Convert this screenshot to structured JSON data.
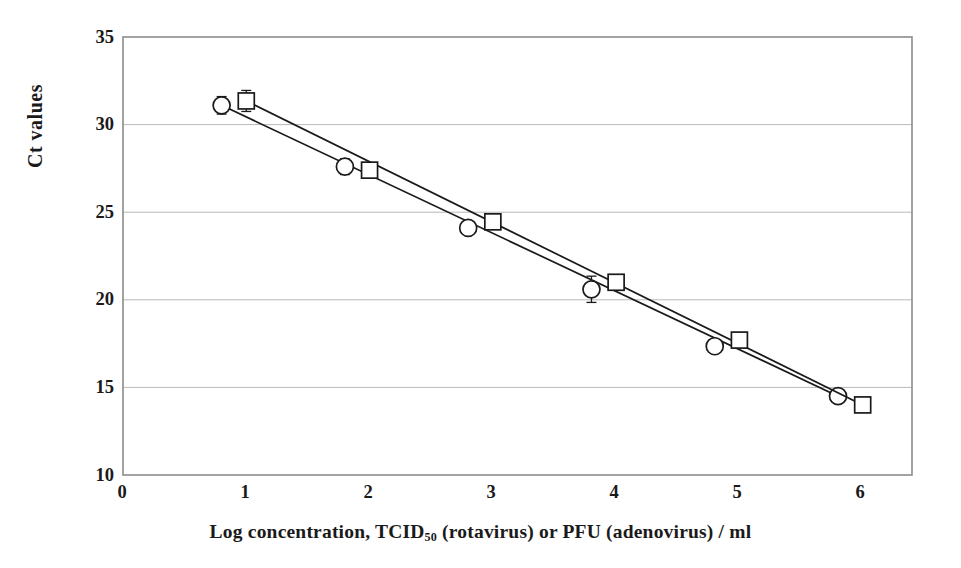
{
  "figure": {
    "background_color": "#ffffff",
    "ink_color": "#1a1a1a",
    "grid_color": "#b9b9b9",
    "frame_color": "#8c8c8c"
  },
  "chart_data": {
    "type": "scatter",
    "title": "",
    "xlabel": "Log  concentration, TCID50 (rotavirus) or PFU (adenovirus) / ml",
    "xlabel_prefix": "Log  concentration, TCID",
    "xlabel_subscript": "50",
    "xlabel_suffix": " (rotavirus) or PFU (adenovirus) / ml",
    "ylabel": "Ct values",
    "xlim": [
      0,
      6.4
    ],
    "ylim": [
      10,
      35
    ],
    "xticks": [
      "0",
      "1",
      "2",
      "3",
      "4",
      "5",
      "6"
    ],
    "xtick_values": [
      0,
      1,
      2,
      3,
      4,
      5,
      6
    ],
    "yticks": [
      "35",
      "30",
      "25",
      "20",
      "15",
      "10"
    ],
    "ytick_values": [
      35,
      30,
      25,
      20,
      15,
      10
    ],
    "grid": "horizontal",
    "legend": "none",
    "series": [
      {
        "name": "rotavirus",
        "marker": "circle",
        "x": [
          0.8,
          1.8,
          2.8,
          3.8,
          4.8,
          5.8
        ],
        "values": [
          31.1,
          27.6,
          24.1,
          20.6,
          17.35,
          14.5
        ],
        "yerr": [
          0.5,
          0.45,
          0.3,
          0.75,
          0.35,
          0.3
        ],
        "fit_line": {
          "x0": 0.8,
          "y0": 31.1,
          "x1": 5.8,
          "y1": 14.5
        }
      },
      {
        "name": "adenovirus",
        "marker": "square",
        "x": [
          1.0,
          2.0,
          3.0,
          4.0,
          5.0,
          6.0
        ],
        "values": [
          31.35,
          27.4,
          24.45,
          21.0,
          17.7,
          14.0
        ],
        "yerr": [
          0.6,
          0.3,
          0.25,
          0.2,
          0.3,
          0.15
        ],
        "fit_line": {
          "x0": 1.0,
          "y0": 31.35,
          "x1": 6.0,
          "y1": 14.0
        }
      }
    ]
  }
}
